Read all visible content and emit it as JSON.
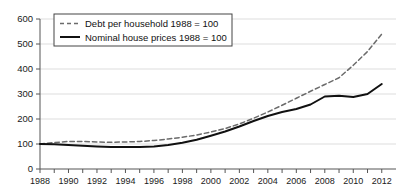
{
  "chart_data": {
    "type": "line",
    "title": "",
    "subtitle": "",
    "xlabel": "",
    "ylabel": "",
    "xlim": [
      1988,
      2013
    ],
    "ylim": [
      0,
      600
    ],
    "yticks": [
      0,
      100,
      200,
      300,
      400,
      500,
      600
    ],
    "xticks": [
      1988,
      1990,
      1992,
      1994,
      1996,
      1998,
      2000,
      2002,
      2004,
      2006,
      2008,
      2010,
      2012
    ],
    "xtick_labels": [
      "1988",
      "1990",
      "1992",
      "1994",
      "1996",
      "1998",
      "2000",
      "2002",
      "2004",
      "2006",
      "2008",
      "2010",
      "2012"
    ],
    "ytick_labels": [
      "0",
      "100",
      "200",
      "300",
      "400",
      "500",
      "600"
    ],
    "grid": "horizontal",
    "legend_position": "top-left",
    "x": [
      1988,
      1989,
      1990,
      1991,
      1992,
      1993,
      1994,
      1995,
      1996,
      1997,
      1998,
      1999,
      2000,
      2001,
      2002,
      2003,
      2004,
      2005,
      2006,
      2007,
      2008,
      2009,
      2010,
      2011,
      2012
    ],
    "series": [
      {
        "name": "Debt per household 1988 = 100",
        "style": "dashed",
        "color": "#6b6b6b",
        "values": [
          100,
          106,
          110,
          110,
          108,
          107,
          108,
          110,
          114,
          120,
          127,
          136,
          148,
          162,
          180,
          203,
          228,
          255,
          283,
          311,
          338,
          365,
          415,
          470,
          540
        ]
      },
      {
        "name": "Nominal house prices 1988 = 100",
        "style": "solid",
        "color": "#111111",
        "values": [
          100,
          99,
          96,
          93,
          90,
          88,
          88,
          88,
          90,
          96,
          105,
          117,
          133,
          150,
          170,
          192,
          212,
          228,
          240,
          258,
          290,
          293,
          288,
          300,
          340
        ]
      }
    ],
    "legend": [
      {
        "label": "Debt per household 1988 = 100",
        "style": "dashed"
      },
      {
        "label": "Nominal house prices 1988 = 100",
        "style": "solid"
      }
    ]
  }
}
